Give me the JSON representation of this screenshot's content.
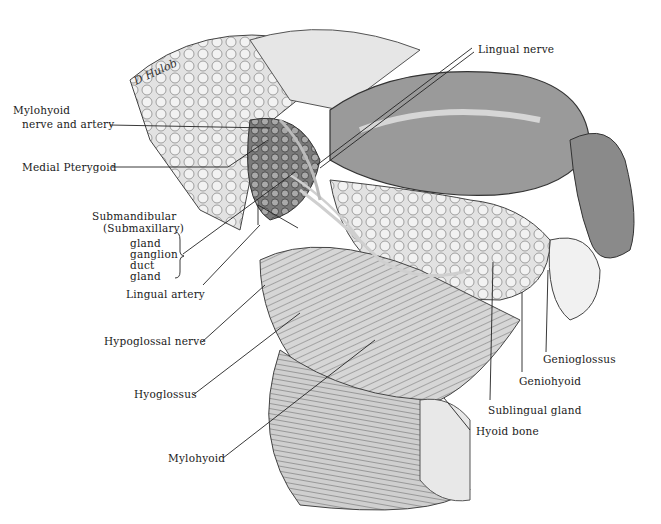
{
  "figure": {
    "signature": "D Hulob",
    "labels": {
      "lingual_nerve": "Lingual nerve",
      "mylohyoid_nerve_line1": "Mylohyoid",
      "mylohyoid_nerve_line2": "nerve and artery",
      "medial_pterygoid": "Medial Pterygoid",
      "submandibular_line1": "Submandibular",
      "submandibular_line2": "(Submaxillary)",
      "sub_gland": "gland",
      "sub_ganglion": "ganglion",
      "sub_duct": "duct",
      "sub_gland2": "gland",
      "lingual_artery": "Lingual artery",
      "hypoglossal_nerve": "Hypoglossal nerve",
      "hyoglossus": "Hyoglossus",
      "mylohyoid": "Mylohyoid",
      "genioglossus": "Genioglossus",
      "geniohyoid": "Geniohyoid",
      "sublingual_gland": "Sublingual gland",
      "hyoid_bone": "Hyoid bone"
    }
  }
}
